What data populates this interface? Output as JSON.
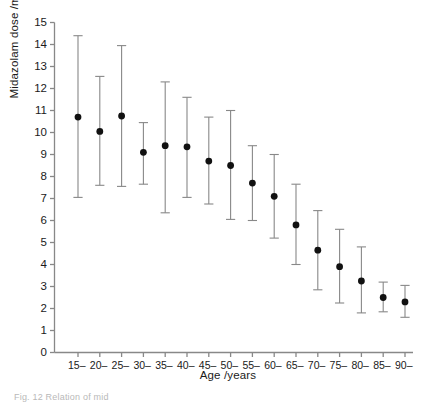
{
  "chart_data": {
    "type": "scatter",
    "title": "",
    "subtitle": "",
    "xlabel": "Age /years",
    "ylabel": "Midazolam dose /mg",
    "categories": [
      "15–",
      "20–",
      "25–",
      "30–",
      "35–",
      "40–",
      "45–",
      "50–",
      "55–",
      "60–",
      "65–",
      "70–",
      "75–",
      "80–",
      "85–",
      "90–"
    ],
    "ytick_labels": [
      "0",
      "1",
      "2",
      "3",
      "4",
      "5",
      "6",
      "7",
      "8",
      "9",
      "10",
      "11",
      "12",
      "13",
      "14",
      "15"
    ],
    "ytick_values": [
      0,
      1,
      2,
      3,
      4,
      5,
      6,
      7,
      8,
      9,
      10,
      11,
      12,
      13,
      14,
      15
    ],
    "ylim": [
      0,
      15
    ],
    "grid": false,
    "legend": null,
    "marker": "filled-circle",
    "error_bars": "vertical-with-caps",
    "series": [
      {
        "name": "Midazolam dose",
        "values": [
          10.7,
          10.05,
          10.75,
          9.1,
          9.4,
          9.35,
          8.7,
          8.5,
          7.7,
          7.1,
          5.8,
          4.65,
          3.9,
          3.25,
          2.5,
          2.3
        ],
        "error_low": [
          7.05,
          7.6,
          7.55,
          7.65,
          6.35,
          7.05,
          6.75,
          6.05,
          6.0,
          5.2,
          4.0,
          2.85,
          2.25,
          1.8,
          1.85,
          1.6
        ],
        "error_high": [
          14.4,
          12.55,
          13.95,
          10.45,
          12.3,
          11.6,
          10.7,
          11.0,
          9.4,
          9.0,
          7.65,
          6.45,
          5.6,
          4.8,
          3.2,
          3.05
        ]
      }
    ],
    "colors": {
      "marker": "#111111",
      "error_bar": "#888888",
      "axis": "#888888",
      "text": "#1a1a1a"
    }
  },
  "caption": {
    "text": "Fig. 12   Relation of mid"
  }
}
